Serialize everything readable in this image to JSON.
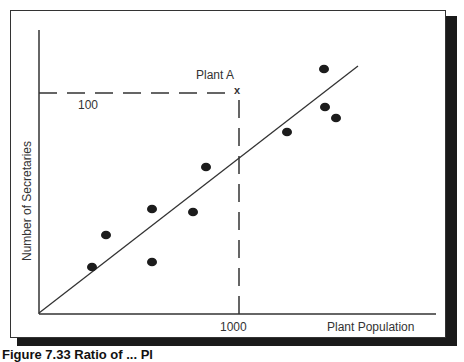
{
  "chart_data": {
    "type": "scatter",
    "title": "",
    "xlabel": "Plant Population",
    "ylabel": "Number of Secretaries",
    "x_ticks": [
      {
        "value": 1000,
        "label": "1000"
      }
    ],
    "y_ticks": [
      {
        "value": 100,
        "label": "100"
      }
    ],
    "grid": false,
    "legend": null,
    "series": [
      {
        "name": "Plants",
        "points_px": [
          [
            92,
            267
          ],
          [
            106,
            235
          ],
          [
            152,
            209
          ],
          [
            152,
            262
          ],
          [
            193,
            212
          ],
          [
            206,
            167
          ],
          [
            287,
            132
          ],
          [
            324,
            69
          ],
          [
            325,
            107
          ],
          [
            336,
            118
          ]
        ]
      }
    ],
    "trend_line": {
      "from_px": [
        39,
        313
      ],
      "to_px": [
        358,
        66
      ]
    },
    "annotation": {
      "label": "Plant A",
      "marker": "x",
      "x_value": 1000,
      "y_value": 100,
      "marker_px": [
        238,
        92
      ]
    },
    "guides": {
      "horizontal_y_px": 93,
      "vertical_x_px": 239
    }
  },
  "labels": {
    "plant_a": "Plant A",
    "marker": "x",
    "y_tick": "100",
    "x_tick": "1000",
    "x_axis": "Plant Population",
    "y_axis": "Number of Secretaries",
    "caption": "Figure 7.33 Ratio of ... Pl"
  }
}
